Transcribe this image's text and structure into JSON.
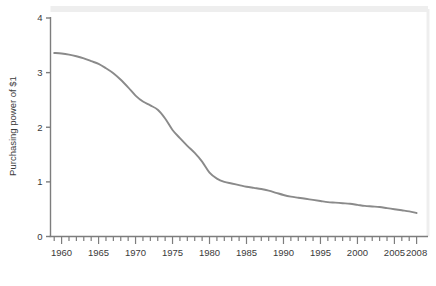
{
  "chart_data": {
    "type": "line",
    "title": "",
    "subtitle": "",
    "xlabel": "",
    "ylabel": "Purchasing power of $1",
    "xlim": [
      1958.5,
      2009.0
    ],
    "ylim": [
      0,
      4
    ],
    "grid": false,
    "legend": null,
    "legend_position": "none",
    "line_color": "#8a8a8a",
    "axis_color": "#7d7d7d",
    "text_color": "#3a3a3a",
    "plot_border_color": "#eeeeee",
    "background_color": "#ffffff",
    "y_ticks": [
      0,
      1,
      2,
      3,
      4
    ],
    "y_tick_labels": [
      "0",
      "1",
      "2",
      "3",
      "4"
    ],
    "x_major_ticks": [
      1960,
      1965,
      1970,
      1975,
      1980,
      1985,
      1990,
      1995,
      2000,
      2005,
      2008
    ],
    "x_tick_labels": [
      "1960",
      "1965",
      "1970",
      "1975",
      "1980",
      "1985",
      "1990",
      "1995",
      "2000",
      "2005",
      "2008"
    ],
    "x_minor_tick_interval": 1,
    "series": [
      {
        "name": "Purchasing power of $1",
        "x": [
          1959,
          1960,
          1961,
          1962,
          1963,
          1964,
          1965,
          1966,
          1967,
          1968,
          1969,
          1970,
          1971,
          1972,
          1973,
          1974,
          1975,
          1976,
          1977,
          1978,
          1979,
          1980,
          1981,
          1982,
          1983,
          1984,
          1985,
          1986,
          1987,
          1988,
          1989,
          1990,
          1991,
          1992,
          1993,
          1994,
          1995,
          1996,
          1997,
          1998,
          1999,
          2000,
          2001,
          2002,
          2003,
          2004,
          2005,
          2006,
          2007,
          2008
        ],
        "values": [
          3.36,
          3.35,
          3.33,
          3.3,
          3.26,
          3.21,
          3.16,
          3.08,
          2.99,
          2.87,
          2.73,
          2.58,
          2.47,
          2.4,
          2.32,
          2.16,
          1.95,
          1.8,
          1.66,
          1.53,
          1.37,
          1.17,
          1.06,
          1.0,
          0.97,
          0.94,
          0.91,
          0.89,
          0.87,
          0.84,
          0.8,
          0.76,
          0.73,
          0.71,
          0.69,
          0.67,
          0.65,
          0.63,
          0.62,
          0.61,
          0.6,
          0.58,
          0.56,
          0.55,
          0.54,
          0.52,
          0.5,
          0.48,
          0.46,
          0.43
        ]
      }
    ]
  }
}
